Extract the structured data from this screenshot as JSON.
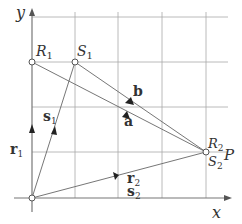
{
  "axes": {
    "x_label": "x",
    "y_label": "y"
  },
  "grid": {
    "color": "#9a9a9a"
  },
  "points": {
    "R1": {
      "label": "R",
      "sub": "1"
    },
    "S1": {
      "label": "S",
      "sub": "1"
    },
    "R2": {
      "label": "R",
      "sub": "2"
    },
    "S2": {
      "label": "S",
      "sub": "2"
    },
    "P": {
      "label": "P"
    }
  },
  "vectors": {
    "r1": {
      "label": "r",
      "sub": "1"
    },
    "s1": {
      "label": "s",
      "sub": "1"
    },
    "r2": {
      "label": "r",
      "sub": "2"
    },
    "s2": {
      "label": "s",
      "sub": "2"
    },
    "a": {
      "label": "a"
    },
    "b": {
      "label": "b"
    }
  }
}
